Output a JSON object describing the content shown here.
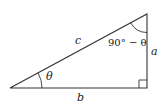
{
  "diagram": {
    "stroke_color": "#333333",
    "vertices": {
      "bottom_left": [
        10,
        88
      ],
      "bottom_right": [
        147,
        88
      ],
      "top_right": [
        147,
        14
      ]
    },
    "labels": {
      "hypotenuse": "c",
      "vertical_side": "a",
      "horizontal_side": "b",
      "bottom_left_angle": "θ",
      "top_angle": "90° − θ"
    },
    "right_angle_marker_size": 8
  }
}
